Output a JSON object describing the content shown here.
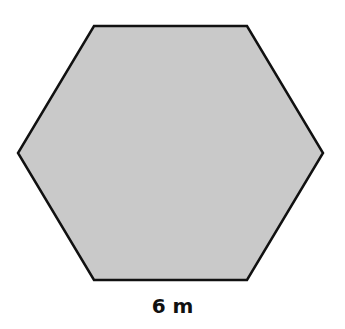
{
  "figure": {
    "shape": "regular hexagon",
    "fill_color": "#c8c8c8",
    "stroke_color": "#111111",
    "side_label": "6 m"
  }
}
